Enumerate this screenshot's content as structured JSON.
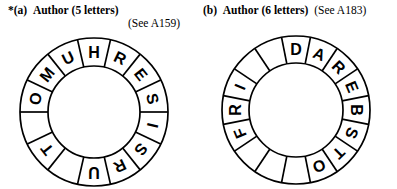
{
  "page": {
    "background": "#ffffff",
    "ink": "#000000"
  },
  "parts": [
    {
      "marker": "*",
      "id": "(a)",
      "word": "Author",
      "count": "(5 letters)",
      "reference": "(See A159)",
      "reference_on_second_line": true
    },
    {
      "marker": "",
      "id": "(b)",
      "word": "Author",
      "count": "(6 letters)",
      "reference": "(See A183)",
      "reference_on_second_line": false
    }
  ],
  "wheels": [
    {
      "name": "wheel-a",
      "segments": 14,
      "start_angle_deg": -90,
      "cx": 94,
      "cy": 112,
      "outer_r": 74,
      "inner_r": 46,
      "letters": [
        "H",
        "R",
        "E",
        "S",
        "I",
        "S",
        "R",
        "U",
        "",
        "T",
        "",
        "O",
        "M",
        "U"
      ]
    },
    {
      "name": "wheel-b",
      "segments": 16,
      "start_angle_deg": -90,
      "cx": 296,
      "cy": 110,
      "outer_r": 74,
      "inner_r": 47,
      "letters": [
        "D",
        "A",
        "R",
        "E",
        "B",
        "S",
        "T",
        "O",
        "",
        "",
        "",
        "F",
        "R",
        "I",
        "",
        ""
      ]
    }
  ]
}
